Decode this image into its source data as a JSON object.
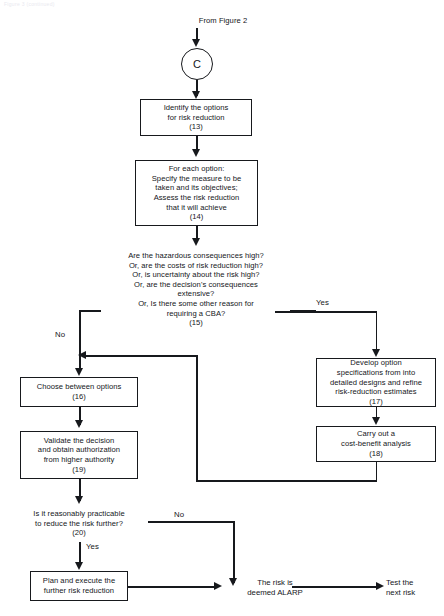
{
  "page": {
    "faint_header": "Figure 3 (continued)"
  },
  "diagram": {
    "entry_label": "From Figure 2",
    "connector_circle": "C",
    "nodes": {
      "n13": "Identify the options\nfor risk reduction\n(13)",
      "n14": "For each option:\nSpecify  the measure to be\ntaken and its objectives;\nAssess the risk reduction\nthat it will achieve\n(14)",
      "n15": "Are the hazardous consequences high?\nOr, are the costs of risk reduction high?\nOr, is uncertainty about the risk high?\nOr, are the decision's consequences\nextensive?\nOr, Is there some other reason for\nrequiring a CBA?\n(15)",
      "n16": "Choose between options\n(16)",
      "n17": "Develop option\nspecifications from into\ndetailed designs and refine\nrisk-reduction  estimates\n(17)",
      "n18": "Carry out a\ncost-benefit  analysis\n(18)",
      "n19": "Validate the decision\nand obtain authorization\nfrom higher authority\n(19)",
      "n20": "Is it reasonably practicable\nto reduce the risk further?\n(20)",
      "n21": "Plan and execute the\nfurther risk reduction",
      "alarp": "The risk is\ndeemed ALARP",
      "next": "Test the\nnext risk"
    },
    "branch_labels": {
      "b15_yes": "Yes",
      "b15_no": "No",
      "b20_no": "No",
      "b20_yes": "Yes"
    }
  }
}
